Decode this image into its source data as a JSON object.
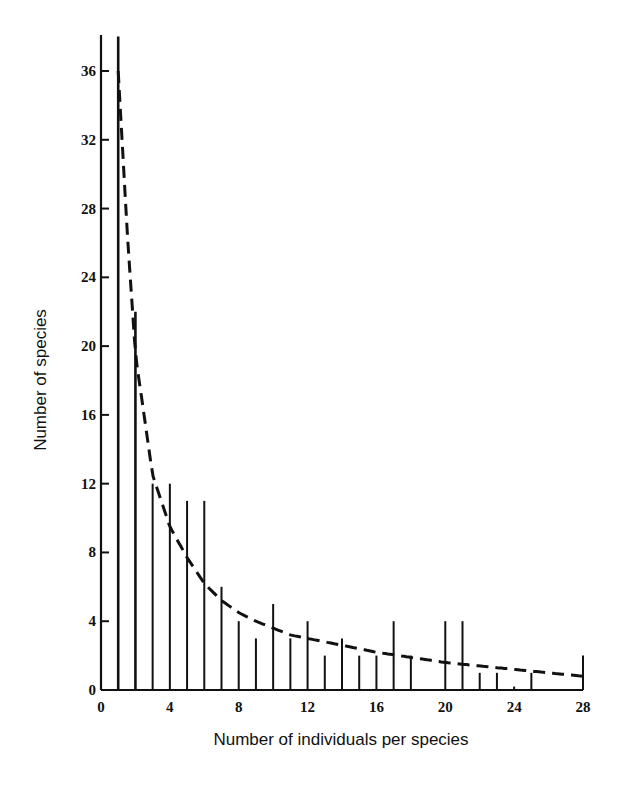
{
  "chart_data": {
    "type": "bar",
    "title": "",
    "xlabel": "Number of individuals per species",
    "ylabel": "Number of species",
    "xlim": [
      0,
      28
    ],
    "ylim": [
      0,
      38
    ],
    "x_ticks": [
      0,
      4,
      8,
      12,
      16,
      20,
      24,
      28
    ],
    "y_ticks": [
      0,
      4,
      8,
      12,
      16,
      20,
      24,
      28,
      32,
      36
    ],
    "grid": false,
    "legend": null,
    "categories": [
      1,
      2,
      3,
      4,
      5,
      6,
      7,
      8,
      9,
      10,
      11,
      12,
      13,
      14,
      15,
      16,
      17,
      18,
      19,
      20,
      21,
      22,
      23,
      24,
      25,
      26,
      27,
      28
    ],
    "series": [
      {
        "name": "Observed species counts",
        "style": "vertical lines",
        "values": [
          38,
          22,
          12,
          12,
          11,
          11,
          6,
          4,
          3,
          5,
          3,
          4,
          2,
          3,
          2,
          2,
          4,
          2,
          0,
          4,
          4,
          1,
          1,
          0.2,
          1,
          0,
          0,
          2
        ]
      },
      {
        "name": "Fitted log-series curve",
        "style": "dashed line",
        "x": [
          1,
          1.5,
          2,
          3,
          4,
          5,
          6,
          7,
          8,
          9,
          10,
          11,
          12,
          14,
          16,
          18,
          20,
          22,
          24,
          26,
          28
        ],
        "values": [
          36,
          27,
          19.5,
          12.5,
          9.5,
          7.7,
          6.2,
          5.2,
          4.5,
          4.0,
          3.6,
          3.2,
          3.0,
          2.6,
          2.2,
          1.9,
          1.6,
          1.4,
          1.2,
          1.0,
          0.8
        ]
      }
    ]
  }
}
